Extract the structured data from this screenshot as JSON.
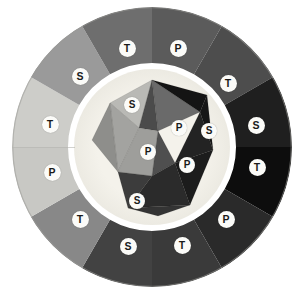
{
  "figure": {
    "kind": "diagram",
    "background_color": "#ffffff",
    "canvas": {
      "width": 306,
      "height": 295
    }
  },
  "wheel": {
    "center": {
      "x": 152,
      "y": 147
    },
    "outer_radius": 140,
    "inner_ring_radius": 84,
    "halo_color": "#f2f0e9",
    "rim_color": "#8d8d8d",
    "segment_count": 12,
    "segments": [
      {
        "index": 0,
        "label": "P",
        "fill": "#5b5b5b",
        "start_deg": -90,
        "end_deg": -60
      },
      {
        "index": 1,
        "label": "T",
        "fill": "#4d4d4d",
        "start_deg": -60,
        "end_deg": -30
      },
      {
        "index": 2,
        "label": "S",
        "fill": "#1f1f1f",
        "start_deg": -30,
        "end_deg": 0
      },
      {
        "index": 3,
        "label": "T",
        "fill": "#0d0d0d",
        "start_deg": 0,
        "end_deg": 30
      },
      {
        "index": 4,
        "label": "P",
        "fill": "#2a2a2a",
        "start_deg": 30,
        "end_deg": 60
      },
      {
        "index": 5,
        "label": "T",
        "fill": "#3a3a3a",
        "start_deg": 60,
        "end_deg": 90
      },
      {
        "index": 6,
        "label": "S",
        "fill": "#424242",
        "start_deg": 90,
        "end_deg": 120
      },
      {
        "index": 7,
        "label": "T",
        "fill": "#888888",
        "start_deg": 120,
        "end_deg": 150
      },
      {
        "index": 8,
        "label": "P",
        "fill": "#c8c8c4",
        "start_deg": 150,
        "end_deg": 180
      },
      {
        "index": 9,
        "label": "T",
        "fill": "#cdcdc9",
        "start_deg": 180,
        "end_deg": 210
      },
      {
        "index": 10,
        "label": "S",
        "fill": "#9a9a9a",
        "start_deg": 210,
        "end_deg": 240
      },
      {
        "index": 11,
        "label": "T",
        "fill": "#6e6e6e",
        "start_deg": 240,
        "end_deg": 270
      }
    ],
    "outer_labels": [
      {
        "letter": "P",
        "x": 178,
        "y": 48
      },
      {
        "letter": "T",
        "x": 228,
        "y": 83
      },
      {
        "letter": "S",
        "x": 256,
        "y": 125
      },
      {
        "letter": "T",
        "x": 257,
        "y": 167
      },
      {
        "letter": "P",
        "x": 226,
        "y": 219
      },
      {
        "letter": "T",
        "x": 182,
        "y": 245
      },
      {
        "letter": "S",
        "x": 128,
        "y": 246
      },
      {
        "letter": "T",
        "x": 80,
        "y": 219
      },
      {
        "letter": "P",
        "x": 52,
        "y": 172
      },
      {
        "letter": "T",
        "x": 50,
        "y": 124
      },
      {
        "letter": "S",
        "x": 80,
        "y": 76
      },
      {
        "letter": "T",
        "x": 127,
        "y": 48
      }
    ]
  },
  "polyhedron": {
    "description": "Icosahedron-like solid at the wheel centre",
    "center": {
      "x": 152,
      "y": 147
    },
    "radius": 66,
    "faces": [
      {
        "id": "f-top-left",
        "fill": "#b9b9b5",
        "points": "110,103 152,80 139,128"
      },
      {
        "id": "f-top-mid",
        "fill": "#6a6a6a",
        "points": "152,80 200,112 158,131"
      },
      {
        "id": "f-top-mid-b",
        "fill": "#4b4b4b",
        "points": "152,80 158,131 139,128"
      },
      {
        "id": "f-upper-right",
        "fill": "#141414",
        "points": "200,112 152,80 207,95"
      },
      {
        "id": "f-right-dark",
        "fill": "#171717",
        "points": "200,112 207,95 213,150"
      },
      {
        "id": "f-right-mid",
        "fill": "#232323",
        "points": "200,112 213,150 175,163"
      },
      {
        "id": "f-center-left",
        "fill": "#a3a3a0",
        "points": "110,103 139,128 118,172"
      },
      {
        "id": "f-center-pale",
        "fill": "#9e9e9b",
        "points": "139,128 158,131 152,176 118,172"
      },
      {
        "id": "f-center-mid",
        "fill": "#4f4f4f",
        "points": "158,131 175,163 152,176"
      },
      {
        "id": "f-lower-left",
        "fill": "#3c3c3c",
        "points": "118,172 152,176 128,208"
      },
      {
        "id": "f-lower-mid",
        "fill": "#2b2b2b",
        "points": "152,176 175,163 190,205 128,208"
      },
      {
        "id": "f-lower-right",
        "fill": "#1c1c1c",
        "points": "175,163 213,150 190,205"
      },
      {
        "id": "f-left-edge",
        "fill": "#8e8e8b",
        "points": "92,140 110,103 118,172"
      },
      {
        "id": "f-bottom-edge",
        "fill": "#343434",
        "points": "128,208 190,205 158,216"
      }
    ],
    "inner_labels": [
      {
        "letter": "S",
        "x": 132,
        "y": 105
      },
      {
        "letter": "P",
        "x": 179,
        "y": 128
      },
      {
        "letter": "S",
        "x": 209,
        "y": 131
      },
      {
        "letter": "P",
        "x": 148,
        "y": 152
      },
      {
        "letter": "P",
        "x": 187,
        "y": 165
      },
      {
        "letter": "S",
        "x": 137,
        "y": 201
      }
    ]
  },
  "legend_keys": {
    "P": "P",
    "S": "S",
    "T": "T"
  }
}
